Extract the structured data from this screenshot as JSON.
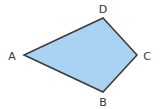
{
  "diagram": {
    "type": "quadrilateral",
    "fill": "#a9d2f3",
    "stroke": "#3a3a3a",
    "vertices": [
      {
        "name": "A",
        "x": 24,
        "y": 55,
        "label_x": 12,
        "label_y": 60
      },
      {
        "name": "B",
        "x": 103,
        "y": 92,
        "label_x": 103,
        "label_y": 106
      },
      {
        "name": "C",
        "x": 137,
        "y": 55,
        "label_x": 147,
        "label_y": 60
      },
      {
        "name": "D",
        "x": 103,
        "y": 18,
        "label_x": 103,
        "label_y": 13
      }
    ],
    "labels": {
      "a": "A",
      "b": "B",
      "c": "C",
      "d": "D"
    }
  }
}
